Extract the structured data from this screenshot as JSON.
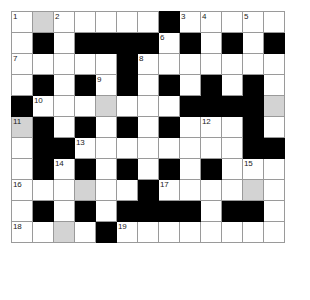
{
  "puzzle": {
    "title": "Crossword Grid",
    "rows": 13,
    "cols": 13,
    "colors": {
      "block": "#000000",
      "shade": "#d3d3d3",
      "cell": "#ffffff",
      "gridline": "#9a9a9a",
      "number": "#222222"
    },
    "clue_numbers": [
      1,
      2,
      3,
      4,
      5,
      6,
      7,
      8,
      9,
      10,
      11,
      12,
      13,
      14,
      15,
      16,
      17,
      18,
      19
    ],
    "cells": [
      [
        {
          "type": "open",
          "num": "1"
        },
        {
          "type": "shade",
          "num": ""
        },
        {
          "type": "open",
          "num": "2"
        },
        {
          "type": "open",
          "num": ""
        },
        {
          "type": "open",
          "num": ""
        },
        {
          "type": "open",
          "num": ""
        },
        {
          "type": "open",
          "num": ""
        },
        {
          "type": "block",
          "num": ""
        },
        {
          "type": "open",
          "num": "3"
        },
        {
          "type": "open",
          "num": "4"
        },
        {
          "type": "open",
          "num": ""
        },
        {
          "type": "open",
          "num": "5"
        },
        {
          "type": "open",
          "num": ""
        }
      ],
      [
        {
          "type": "open",
          "num": ""
        },
        {
          "type": "block",
          "num": ""
        },
        {
          "type": "open",
          "num": ""
        },
        {
          "type": "block",
          "num": ""
        },
        {
          "type": "block",
          "num": ""
        },
        {
          "type": "block",
          "num": ""
        },
        {
          "type": "block",
          "num": ""
        },
        {
          "type": "open",
          "num": "6"
        },
        {
          "type": "block",
          "num": ""
        },
        {
          "type": "open",
          "num": ""
        },
        {
          "type": "block",
          "num": ""
        },
        {
          "type": "open",
          "num": ""
        },
        {
          "type": "block",
          "num": ""
        }
      ],
      [
        {
          "type": "open",
          "num": "7"
        },
        {
          "type": "open",
          "num": ""
        },
        {
          "type": "open",
          "num": ""
        },
        {
          "type": "open",
          "num": ""
        },
        {
          "type": "open",
          "num": ""
        },
        {
          "type": "block",
          "num": ""
        },
        {
          "type": "open",
          "num": "8"
        },
        {
          "type": "open",
          "num": ""
        },
        {
          "type": "open",
          "num": ""
        },
        {
          "type": "open",
          "num": ""
        },
        {
          "type": "open",
          "num": ""
        },
        {
          "type": "open",
          "num": ""
        },
        {
          "type": "open",
          "num": ""
        }
      ],
      [
        {
          "type": "open",
          "num": ""
        },
        {
          "type": "block",
          "num": ""
        },
        {
          "type": "open",
          "num": ""
        },
        {
          "type": "block",
          "num": ""
        },
        {
          "type": "open",
          "num": "9"
        },
        {
          "type": "block",
          "num": ""
        },
        {
          "type": "open",
          "num": ""
        },
        {
          "type": "block",
          "num": ""
        },
        {
          "type": "open",
          "num": ""
        },
        {
          "type": "block",
          "num": ""
        },
        {
          "type": "open",
          "num": ""
        },
        {
          "type": "block",
          "num": ""
        },
        {
          "type": "open",
          "num": ""
        }
      ],
      [
        {
          "type": "block",
          "num": ""
        },
        {
          "type": "open",
          "num": "10"
        },
        {
          "type": "open",
          "num": ""
        },
        {
          "type": "open",
          "num": ""
        },
        {
          "type": "shade",
          "num": ""
        },
        {
          "type": "open",
          "num": ""
        },
        {
          "type": "open",
          "num": ""
        },
        {
          "type": "open",
          "num": ""
        },
        {
          "type": "block",
          "num": ""
        },
        {
          "type": "block",
          "num": ""
        },
        {
          "type": "block",
          "num": ""
        },
        {
          "type": "block",
          "num": ""
        },
        {
          "type": "shade",
          "num": ""
        }
      ],
      [
        {
          "type": "shade",
          "num": "11"
        },
        {
          "type": "block",
          "num": ""
        },
        {
          "type": "open",
          "num": ""
        },
        {
          "type": "block",
          "num": ""
        },
        {
          "type": "open",
          "num": ""
        },
        {
          "type": "block",
          "num": ""
        },
        {
          "type": "open",
          "num": ""
        },
        {
          "type": "block",
          "num": ""
        },
        {
          "type": "open",
          "num": ""
        },
        {
          "type": "open",
          "num": "12"
        },
        {
          "type": "open",
          "num": ""
        },
        {
          "type": "block",
          "num": ""
        },
        {
          "type": "open",
          "num": ""
        }
      ],
      [
        {
          "type": "open",
          "num": ""
        },
        {
          "type": "block",
          "num": ""
        },
        {
          "type": "block",
          "num": ""
        },
        {
          "type": "open",
          "num": "13"
        },
        {
          "type": "open",
          "num": ""
        },
        {
          "type": "open",
          "num": ""
        },
        {
          "type": "open",
          "num": ""
        },
        {
          "type": "open",
          "num": ""
        },
        {
          "type": "open",
          "num": ""
        },
        {
          "type": "open",
          "num": ""
        },
        {
          "type": "open",
          "num": ""
        },
        {
          "type": "block",
          "num": ""
        },
        {
          "type": "block",
          "num": ""
        }
      ],
      [
        {
          "type": "open",
          "num": ""
        },
        {
          "type": "block",
          "num": ""
        },
        {
          "type": "open",
          "num": "14"
        },
        {
          "type": "block",
          "num": ""
        },
        {
          "type": "open",
          "num": ""
        },
        {
          "type": "block",
          "num": ""
        },
        {
          "type": "open",
          "num": ""
        },
        {
          "type": "block",
          "num": ""
        },
        {
          "type": "open",
          "num": ""
        },
        {
          "type": "block",
          "num": ""
        },
        {
          "type": "open",
          "num": ""
        },
        {
          "type": "open",
          "num": "15"
        },
        {
          "type": "open",
          "num": ""
        }
      ],
      [
        {
          "type": "open",
          "num": "16"
        },
        {
          "type": "open",
          "num": ""
        },
        {
          "type": "open",
          "num": ""
        },
        {
          "type": "shade",
          "num": ""
        },
        {
          "type": "open",
          "num": ""
        },
        {
          "type": "open",
          "num": ""
        },
        {
          "type": "block",
          "num": ""
        },
        {
          "type": "open",
          "num": "17"
        },
        {
          "type": "open",
          "num": ""
        },
        {
          "type": "open",
          "num": ""
        },
        {
          "type": "open",
          "num": ""
        },
        {
          "type": "shade",
          "num": ""
        },
        {
          "type": "open",
          "num": ""
        }
      ],
      [
        {
          "type": "open",
          "num": ""
        },
        {
          "type": "block",
          "num": ""
        },
        {
          "type": "open",
          "num": ""
        },
        {
          "type": "block",
          "num": ""
        },
        {
          "type": "open",
          "num": ""
        },
        {
          "type": "block",
          "num": ""
        },
        {
          "type": "block",
          "num": ""
        },
        {
          "type": "block",
          "num": ""
        },
        {
          "type": "block",
          "num": ""
        },
        {
          "type": "open",
          "num": ""
        },
        {
          "type": "block",
          "num": ""
        },
        {
          "type": "block",
          "num": ""
        },
        {
          "type": "open",
          "num": ""
        }
      ],
      [
        {
          "type": "open",
          "num": "18"
        },
        {
          "type": "open",
          "num": ""
        },
        {
          "type": "shade",
          "num": ""
        },
        {
          "type": "open",
          "num": ""
        },
        {
          "type": "block",
          "num": ""
        },
        {
          "type": "open",
          "num": "19"
        },
        {
          "type": "open",
          "num": ""
        },
        {
          "type": "open",
          "num": ""
        },
        {
          "type": "open",
          "num": ""
        },
        {
          "type": "open",
          "num": ""
        },
        {
          "type": "open",
          "num": ""
        },
        {
          "type": "open",
          "num": ""
        },
        {
          "type": "open",
          "num": ""
        }
      ]
    ]
  }
}
